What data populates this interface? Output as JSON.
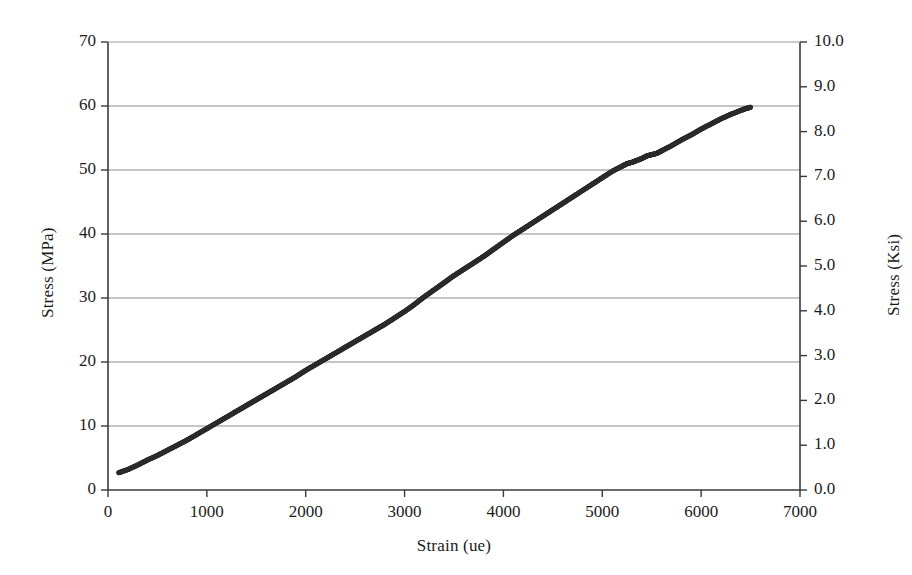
{
  "chart_data": {
    "type": "line",
    "title": "",
    "subtitle": "",
    "xlabel": "Strain (ue)",
    "ylabel": "Stress (MPa)",
    "y2label": "Stress (Ksi)",
    "xlim": [
      0,
      7000
    ],
    "ylim": [
      0,
      70
    ],
    "y2lim": [
      0.0,
      10.0
    ],
    "xticks": [
      0,
      1000,
      2000,
      3000,
      4000,
      5000,
      6000,
      7000
    ],
    "xtick_labels": [
      "0",
      "1000",
      "2000",
      "3000",
      "4000",
      "5000",
      "6000",
      "7000"
    ],
    "yticks": [
      0,
      10,
      20,
      30,
      40,
      50,
      60,
      70
    ],
    "ytick_labels": [
      "0",
      "10",
      "20",
      "30",
      "40",
      "50",
      "60",
      "70"
    ],
    "y2ticks": [
      0.0,
      1.0,
      2.0,
      3.0,
      4.0,
      5.0,
      6.0,
      7.0,
      8.0,
      9.0,
      10.0
    ],
    "y2tick_labels": [
      "0.0",
      "1.0",
      "2.0",
      "3.0",
      "4.0",
      "5.0",
      "6.0",
      "7.0",
      "8.0",
      "9.0",
      "10.0"
    ],
    "grid": {
      "horizontal": true,
      "vertical": false,
      "color": "#8b8b8b"
    },
    "legend": {
      "visible": false,
      "position": "none",
      "entries": []
    },
    "annotations": [],
    "series": [
      {
        "name": "Stress-Strain Curve",
        "color": "#2b2b2b",
        "line_width": 5,
        "x": [
          110,
          200,
          300,
          400,
          500,
          600,
          700,
          800,
          900,
          1000,
          1100,
          1200,
          1300,
          1400,
          1500,
          1600,
          1700,
          1800,
          1900,
          2000,
          2100,
          2200,
          2300,
          2400,
          2500,
          2600,
          2700,
          2800,
          2900,
          3000,
          3100,
          3200,
          3300,
          3400,
          3500,
          3600,
          3700,
          3800,
          3900,
          4000,
          4100,
          4200,
          4300,
          4400,
          4500,
          4600,
          4700,
          4800,
          4900,
          5000,
          5100,
          5200,
          5250,
          5300,
          5350,
          5400,
          5450,
          5500,
          5550,
          5600,
          5700,
          5800,
          5900,
          6000,
          6100,
          6200,
          6300,
          6400,
          6450,
          6500
        ],
        "y": [
          2.7,
          3.2,
          3.9,
          4.7,
          5.4,
          6.2,
          7.0,
          7.8,
          8.7,
          9.6,
          10.5,
          11.4,
          12.3,
          13.2,
          14.1,
          15.0,
          15.9,
          16.8,
          17.7,
          18.7,
          19.6,
          20.5,
          21.4,
          22.3,
          23.2,
          24.1,
          25.0,
          25.9,
          26.9,
          27.9,
          29.0,
          30.2,
          31.3,
          32.4,
          33.5,
          34.5,
          35.5,
          36.5,
          37.6,
          38.7,
          39.8,
          40.8,
          41.8,
          42.8,
          43.8,
          44.8,
          45.8,
          46.8,
          47.8,
          48.8,
          49.8,
          50.6,
          51.0,
          51.2,
          51.5,
          51.8,
          52.2,
          52.4,
          52.6,
          53.0,
          53.8,
          54.7,
          55.5,
          56.4,
          57.2,
          58.0,
          58.7,
          59.3,
          59.6,
          59.8
        ],
        "marker": "dot-dense"
      }
    ]
  }
}
